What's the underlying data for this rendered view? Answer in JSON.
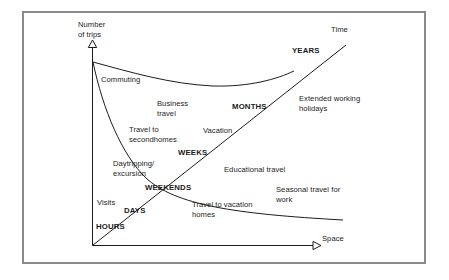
{
  "figure": {
    "type": "conceptual-diagram",
    "title_visible": false,
    "frame_color": "#8a8a8a",
    "line_color": "#1c1c1c",
    "text_color": "#1c1c1c",
    "background": "#ffffff"
  },
  "axes": {
    "y_axis": {
      "name": "y-axis",
      "label_line1": "Number",
      "label_line2": "of trips",
      "arrow": "open-triangle-up"
    },
    "x_axis": {
      "name": "x-axis",
      "label": "Space",
      "arrow": "open-triangle-right"
    },
    "diagonal": {
      "name": "time-diagonal",
      "label": "Time"
    }
  },
  "time_scale_labels": [
    {
      "text": "HOURS"
    },
    {
      "text": "DAYS"
    },
    {
      "text": "WEEKENDS"
    },
    {
      "text": "WEEKS"
    },
    {
      "text": "MONTHS"
    },
    {
      "text": "YEARS"
    }
  ],
  "trip_labels": [
    {
      "text": "Commuting"
    },
    {
      "text": "Business\ntravel"
    },
    {
      "text": "Travel to\nsecondhomes"
    },
    {
      "text": "Vacation"
    },
    {
      "text": "Daytripping/\nexcursion"
    },
    {
      "text": "Visits"
    },
    {
      "text": "Educational travel"
    },
    {
      "text": "Extended working\nholidays"
    },
    {
      "text": "Seasonal travel for\nwork"
    },
    {
      "text": "Travel to vacation\nhomes"
    }
  ],
  "labels": {
    "y_axis_line1": "Number",
    "y_axis_line2": "of trips",
    "x_axis": "Space",
    "time": "Time",
    "years": "YEARS",
    "months": "MONTHS",
    "weeks": "WEEKS",
    "weekends": "WEEKENDS",
    "days": "DAYS",
    "hours": "HOURS",
    "commuting": "Commuting",
    "business_travel_l1": "Business",
    "business_travel_l2": "travel",
    "travel_second_l1": "Travel to",
    "travel_second_l2": "secondhomes",
    "vacation": "Vacation",
    "daytripping_l1": "Daytripping/",
    "daytripping_l2": "excursion",
    "visits": "Visits",
    "educational_travel": "Educational travel",
    "extended_l1": "Extended working",
    "extended_l2": "holidays",
    "seasonal_l1": "Seasonal travel for",
    "seasonal_l2": "work",
    "vacation_homes_l1": "Travel to vacation",
    "vacation_homes_l2": "homes"
  }
}
